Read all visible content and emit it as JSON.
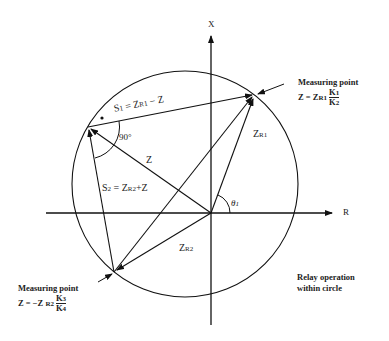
{
  "diagram": {
    "axes": {
      "x_label": "X",
      "r_label": "R"
    },
    "vectors": {
      "s1": {
        "S": "S",
        "sub": "1",
        "eq": " = Z",
        "sub2": "R1",
        "rest": " − Z"
      },
      "s2": {
        "S": "S",
        "sub": "2",
        "eq": " = Z",
        "sub2": "R2",
        "rest": "+Z"
      },
      "z": "Z",
      "zr1": {
        "main": "Z",
        "sub": "R1"
      },
      "zr2": {
        "main": "Z",
        "sub": "R2"
      },
      "theta": {
        "main": "θ",
        "sub": "1"
      },
      "angle": "90°"
    },
    "measuring_point_top": {
      "title": "Measuring point",
      "expr_prefix": "Z = Z",
      "expr_sub": "R1",
      "num": "K",
      "num_sub": "1",
      "den": "K",
      "den_sub": "2"
    },
    "measuring_point_bottom": {
      "title": "Measuring point",
      "expr_prefix": "Z =  −Z",
      "expr_sub": "R2",
      "num": "K",
      "num_sub": "3",
      "den": "K",
      "den_sub": "4"
    },
    "note": {
      "line1": "Relay operation",
      "line2": "within circle"
    }
  }
}
